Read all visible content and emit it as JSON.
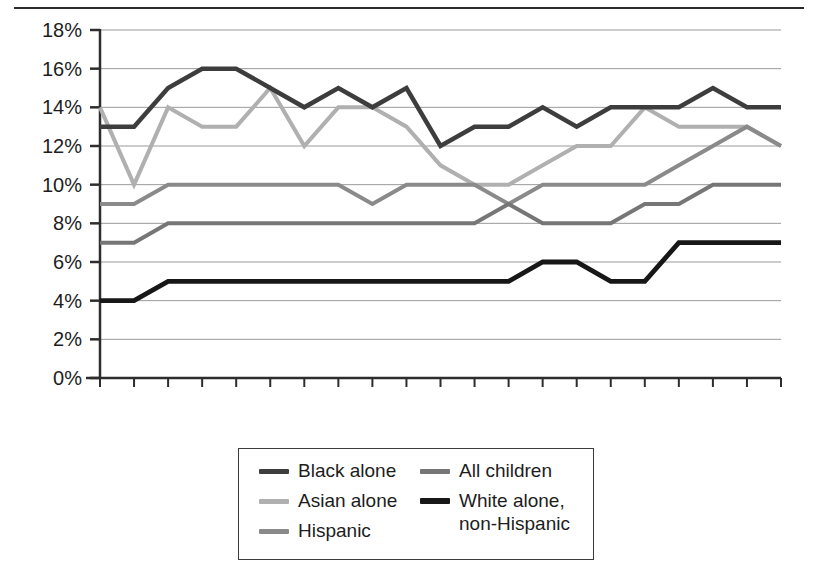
{
  "chart_data": {
    "type": "line",
    "title": "",
    "subtitle": "",
    "xlabel": "",
    "ylabel": "",
    "x": [
      1992,
      1993,
      1994,
      1995,
      1996,
      1997,
      1998,
      1999,
      2000,
      2001,
      2002,
      2003,
      2004,
      2005,
      2006,
      2007,
      2008,
      2009,
      2010,
      2011,
      2012
    ],
    "xlim": [
      1992,
      2012
    ],
    "ylim": [
      0,
      18
    ],
    "xtick_labels": [
      "1992",
      "1995",
      "2000",
      "2004",
      "2008",
      "2012"
    ],
    "xtick_values": [
      1992,
      1995,
      2000,
      2004,
      2008,
      2012
    ],
    "ytick_labels": [
      "0%",
      "2%",
      "4%",
      "6%",
      "8%",
      "10%",
      "12%",
      "14%",
      "16%",
      "18%"
    ],
    "ytick_values": [
      0,
      2,
      4,
      6,
      8,
      10,
      12,
      14,
      16,
      18
    ],
    "grid": "horizontal",
    "legend_position": "bottom-center",
    "series": [
      {
        "name": "Black alone",
        "color": "#3d3d3d",
        "width": 4.5,
        "values": [
          13,
          13,
          15,
          16,
          16,
          15,
          14,
          15,
          14,
          15,
          12,
          13,
          13,
          14,
          13,
          14,
          14,
          14,
          15,
          14,
          14
        ]
      },
      {
        "name": "Asian alone",
        "color": "#b0b0b0",
        "width": 4.0,
        "values": [
          14,
          10,
          14,
          13,
          13,
          15,
          12,
          14,
          14,
          13,
          11,
          10,
          10,
          11,
          12,
          12,
          14,
          13,
          13,
          13,
          12
        ]
      },
      {
        "name": "Hispanic",
        "color": "#8a8a8a",
        "width": 4.0,
        "values": [
          9,
          9,
          10,
          10,
          10,
          10,
          10,
          10,
          9,
          10,
          10,
          10,
          9,
          10,
          10,
          10,
          10,
          11,
          12,
          13,
          12
        ]
      },
      {
        "name": "All children",
        "color": "#767676",
        "width": 4.0,
        "values": [
          7,
          7,
          8,
          8,
          8,
          8,
          8,
          8,
          8,
          8,
          8,
          8,
          9,
          8,
          8,
          8,
          9,
          9,
          10,
          10,
          10
        ]
      },
      {
        "name": "White alone,\nnon-Hispanic",
        "color": "#171717",
        "width": 4.8,
        "values": [
          4,
          4,
          5,
          5,
          5,
          5,
          5,
          5,
          5,
          5,
          5,
          5,
          5,
          6,
          6,
          5,
          5,
          7,
          7,
          7,
          7
        ]
      }
    ]
  },
  "legend": {
    "left_column": [
      {
        "label": "Black alone",
        "color": "#3d3d3d",
        "thick": false
      },
      {
        "label": "Asian alone",
        "color": "#b0b0b0",
        "thick": false
      },
      {
        "label": "Hispanic",
        "color": "#8a8a8a",
        "thick": false
      }
    ],
    "right_column": [
      {
        "label": "All children",
        "color": "#767676",
        "thick": false
      },
      {
        "label": "White alone,\nnon-Hispanic",
        "color": "#171717",
        "thick": true
      }
    ]
  },
  "axes": {
    "y_tick_labels": [
      "18%",
      "16%",
      "14%",
      "12%",
      "10%",
      "8%",
      "6%",
      "4%",
      "2%",
      "0%"
    ],
    "x_tick_labels": [
      "1992",
      "1995",
      "2000",
      "2004",
      "2008",
      "2012"
    ]
  }
}
